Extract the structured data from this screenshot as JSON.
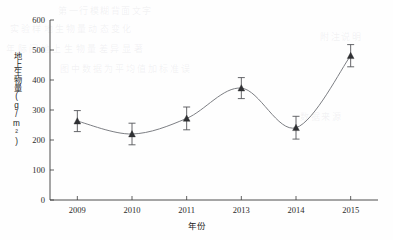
{
  "chart_data": {
    "type": "line",
    "title": "",
    "xlabel": "年份",
    "ylabel": "地上生物量(g/m²)",
    "categories": [
      "2009",
      "2010",
      "2011",
      "2013",
      "2014",
      "2015"
    ],
    "values": [
      263,
      220,
      272,
      373,
      241,
      481
    ],
    "errors": [
      35,
      36,
      38,
      35,
      38,
      37
    ],
    "error_upper": [
      298,
      256,
      310,
      408,
      279,
      518
    ],
    "error_lower": [
      228,
      184,
      234,
      338,
      203,
      444
    ],
    "ylim": [
      0,
      600
    ],
    "ytick_labels": [
      "0",
      "100",
      "200",
      "300",
      "400",
      "500",
      "600"
    ],
    "ytick_values": [
      0,
      100,
      200,
      300,
      400,
      500,
      600
    ],
    "grid": false,
    "legend": "none",
    "marker": "triangle",
    "line_style": "smooth-spline",
    "colors": {
      "line": "#7d7f84",
      "marker": "#2f3033",
      "error_bar": "#55565a",
      "axis": "#3a3a3a",
      "background": "#fefefe",
      "text": "#1d1d1d"
    }
  },
  "ylabel_parts": {
    "main": "地上生物量",
    "unit_open": "(g/m",
    "unit_sup": "2",
    "unit_close": ")"
  },
  "bleed_text": {
    "line1": "第一行模糊背面文字",
    "line2": "实验样地生物量动态变化",
    "line3": "年际间地上生物量差异显著",
    "line4": "图中数据为平均值加标准误",
    "line5": "附注说明",
    "line6": "数据来源"
  }
}
